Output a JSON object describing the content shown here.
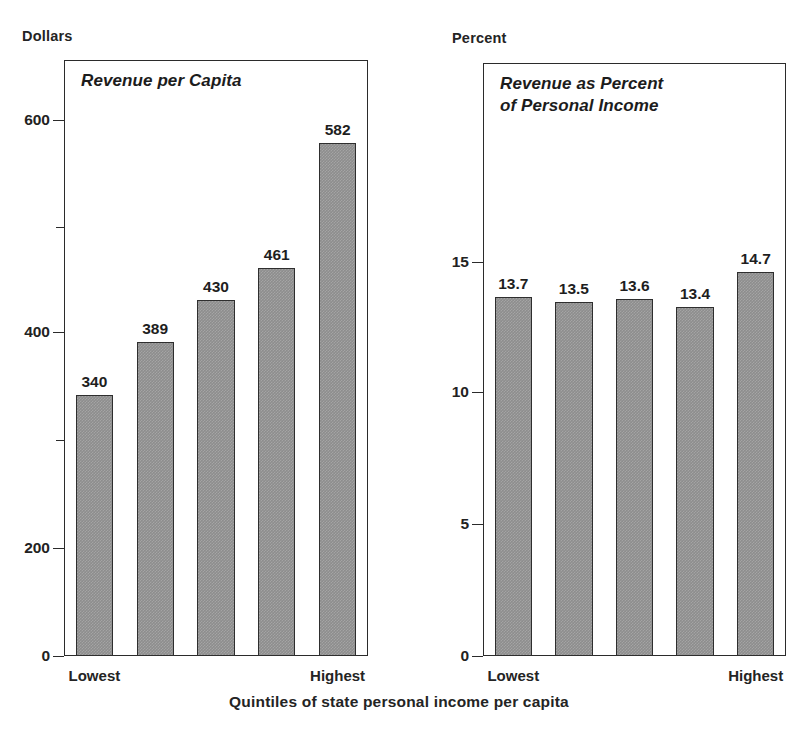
{
  "figure": {
    "x_axis_caption": "Quintiles of state personal income per capita",
    "bar_fill_color": "#8d8d8d",
    "bar_border_color": "#2e2e2e",
    "frame_color": "#2b2b2b",
    "text_color": "#1e1e1e"
  },
  "panels": [
    {
      "id": "revenue-per-capita",
      "unit_caption": "Dollars",
      "title": "Revenue per Capita",
      "y_ticks": [
        {
          "label": "600",
          "value": 600,
          "pos": 10.0,
          "minor": false
        },
        {
          "label": "",
          "value": 500,
          "pos": 28.0,
          "minor": true
        },
        {
          "label": "400",
          "value": 400,
          "pos": 45.7,
          "minor": false
        },
        {
          "label": "",
          "value": 300,
          "pos": 63.7,
          "minor": true
        },
        {
          "label": "200",
          "value": 200,
          "pos": 81.9,
          "minor": false
        },
        {
          "label": "0",
          "value": 0,
          "pos": 100.0,
          "minor": false
        }
      ],
      "bars": [
        {
          "label": "340",
          "value": 340,
          "top_pct": 56.2
        },
        {
          "label": "389",
          "value": 389,
          "top_pct": 47.3
        },
        {
          "label": "430",
          "value": 430,
          "top_pct": 40.3
        },
        {
          "label": "461",
          "value": 461,
          "top_pct": 34.9
        },
        {
          "label": "582",
          "value": 582,
          "top_pct": 13.9
        }
      ],
      "cat_first": "Lowest",
      "cat_last": "Highest"
    },
    {
      "id": "revenue-as-percent-of-personal-income",
      "unit_caption": "Percent",
      "title": "Revenue as Percent\nof Personal Income",
      "y_ticks": [
        {
          "label": "15",
          "value": 15,
          "pos": 33.6,
          "minor": false
        },
        {
          "label": "10",
          "value": 10,
          "pos": 55.5,
          "minor": false
        },
        {
          "label": "5",
          "value": 5,
          "pos": 77.7,
          "minor": false
        },
        {
          "label": "0",
          "value": 0,
          "pos": 100.0,
          "minor": false
        }
      ],
      "bars": [
        {
          "label": "13.7",
          "value": 13.7,
          "top_pct": 39.4
        },
        {
          "label": "13.5",
          "value": 13.5,
          "top_pct": 40.3
        },
        {
          "label": "13.6",
          "value": 13.6,
          "top_pct": 39.8
        },
        {
          "label": "13.4",
          "value": 13.4,
          "top_pct": 41.1
        },
        {
          "label": "14.7",
          "value": 14.7,
          "top_pct": 35.2
        }
      ],
      "cat_first": "Lowest",
      "cat_last": "Highest"
    }
  ],
  "chart_data": [
    {
      "type": "bar",
      "title": "Revenue per Capita",
      "xlabel": "Quintiles of state personal income per capita",
      "ylabel": "Dollars",
      "categories": [
        "Lowest",
        "2",
        "3",
        "4",
        "Highest"
      ],
      "values": [
        340,
        389,
        430,
        461,
        582
      ],
      "data_labels": [
        "340",
        "389",
        "430",
        "461",
        "582"
      ],
      "ytick_labels": [
        "0",
        "200",
        "400",
        "600"
      ],
      "ytick_values": [
        0,
        200,
        400,
        600
      ],
      "minor_ytick_values": [
        300,
        500
      ],
      "ylim": [
        0,
        640
      ],
      "grid": false,
      "legend": false
    },
    {
      "type": "bar",
      "title": "Revenue as Percent of Personal Income",
      "xlabel": "Quintiles of state personal income per capita",
      "ylabel": "Percent",
      "categories": [
        "Lowest",
        "2",
        "3",
        "4",
        "Highest"
      ],
      "values": [
        13.7,
        13.5,
        13.6,
        13.4,
        14.7
      ],
      "data_labels": [
        "13.7",
        "13.5",
        "13.6",
        "13.4",
        "14.7"
      ],
      "ytick_labels": [
        "0",
        "5",
        "10",
        "15"
      ],
      "ytick_values": [
        0,
        5,
        10,
        15
      ],
      "minor_ytick_values": [],
      "ylim": [
        0,
        16.5
      ],
      "grid": false,
      "legend": false
    }
  ]
}
